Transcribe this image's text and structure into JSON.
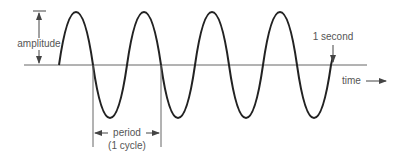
{
  "diagram": {
    "type": "sine-wave",
    "cycles": 4,
    "labels": {
      "amplitude": "amplitude",
      "one_second": "1 second",
      "time": "time",
      "period": "period",
      "one_cycle": "(1 cycle)"
    },
    "colors": {
      "wave": "#222222",
      "axis": "#666666",
      "annotation": "#444444",
      "text": "#555555"
    }
  }
}
